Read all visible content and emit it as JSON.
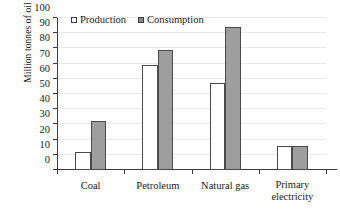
{
  "chart_data": {
    "type": "bar",
    "title": "",
    "subtitle": "",
    "xlabel": "",
    "ylabel": "Million tonnes of oil equivalent",
    "categories": [
      "Coal",
      "Petroleum",
      "Natural gas",
      "Primary electricity"
    ],
    "category_lines": [
      [
        "Coal"
      ],
      [
        "Petroleum"
      ],
      [
        "Natural gas"
      ],
      [
        "Primary",
        "electricity"
      ]
    ],
    "series": [
      {
        "name": "Production",
        "values": [
          12,
          69,
          57.5,
          15.5
        ],
        "color": "#ffffff",
        "edge_color": "#4a4a4a"
      },
      {
        "name": "Consumption",
        "values": [
          32,
          79,
          94,
          16
        ],
        "color": "#9e9e9e",
        "edge_color": "#4a4a4a"
      }
    ],
    "ylim": [
      0,
      100
    ],
    "ytick_values": [
      0,
      10,
      20,
      30,
      40,
      50,
      60,
      70,
      80,
      90,
      100
    ],
    "ytick_labels": [
      "0",
      "10",
      "20",
      "30",
      "40",
      "50",
      "60",
      "70",
      "80",
      "90",
      "100"
    ],
    "grid": true,
    "grid_axis": "y",
    "legend_position": "top-inside-left",
    "legend_entries": [
      "Production",
      "Consumption"
    ]
  }
}
